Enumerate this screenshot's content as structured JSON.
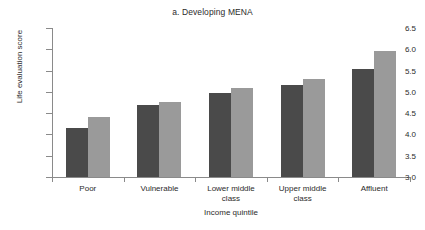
{
  "chart_data": {
    "type": "bar",
    "title": "a. Developing MENA",
    "xlabel": "Income quintile",
    "ylabel": "Life evaluation score",
    "categories": [
      "Poor",
      "Vulnerable",
      "Lower middle class",
      "Upper middle class",
      "Affluent"
    ],
    "category_lines": [
      [
        "Poor"
      ],
      [
        "Vulnerable"
      ],
      [
        "Lower middle",
        "class"
      ],
      [
        "Upper middle",
        "class"
      ],
      [
        "Affluent"
      ]
    ],
    "series": [
      {
        "name": "series-1",
        "color": "#4a4a4a",
        "values": [
          4.15,
          4.68,
          4.97,
          5.17,
          5.53
        ]
      },
      {
        "name": "series-2",
        "color": "#9a9a9a",
        "values": [
          4.42,
          4.77,
          5.1,
          5.3,
          5.95
        ]
      }
    ],
    "ylim": [
      3.0,
      6.5
    ],
    "yticks": [
      "3.0",
      "3.5",
      "4.0",
      "4.5",
      "5.0",
      "5.5",
      "6.0",
      "6.5"
    ],
    "ytick_values": [
      3.0,
      3.5,
      4.0,
      4.5,
      5.0,
      5.5,
      6.0,
      6.5
    ],
    "grid": false,
    "legend": "none"
  }
}
